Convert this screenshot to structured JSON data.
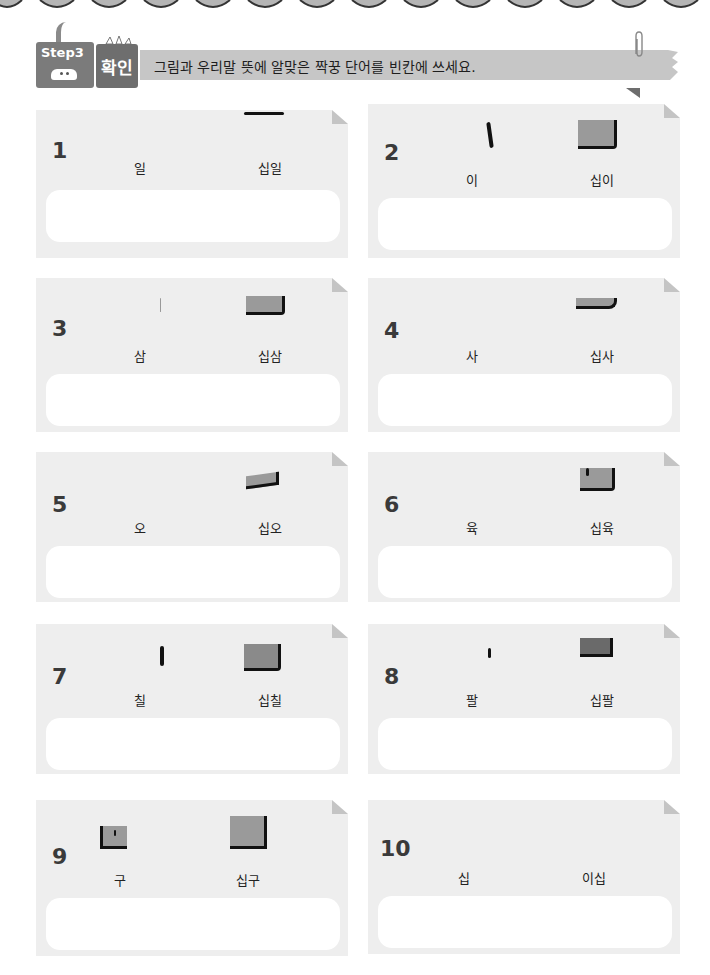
{
  "header": {
    "step_label": "Step3",
    "badge_label": "확인",
    "instruction": "그림과 우리말 뜻에 알맞은 짝꿍 단어를 빈칸에 쓰세요.",
    "decorations": [
      "scallop-border",
      "paperclip-icon",
      "critter-icon"
    ]
  },
  "cards": [
    {
      "number": "1",
      "word_left": "일",
      "word_right": "십일",
      "answer": ""
    },
    {
      "number": "2",
      "word_left": "이",
      "word_right": "십이",
      "answer": ""
    },
    {
      "number": "3",
      "word_left": "삼",
      "word_right": "십삼",
      "answer": ""
    },
    {
      "number": "4",
      "word_left": "사",
      "word_right": "십사",
      "answer": ""
    },
    {
      "number": "5",
      "word_left": "오",
      "word_right": "십오",
      "answer": ""
    },
    {
      "number": "6",
      "word_left": "육",
      "word_right": "십육",
      "answer": ""
    },
    {
      "number": "7",
      "word_left": "칠",
      "word_right": "십칠",
      "answer": ""
    },
    {
      "number": "8",
      "word_left": "팔",
      "word_right": "십팔",
      "answer": ""
    },
    {
      "number": "9",
      "word_left": "구",
      "word_right": "십구",
      "answer": ""
    },
    {
      "number": "10",
      "word_left": "십",
      "word_right": "이십",
      "answer": ""
    }
  ],
  "colors": {
    "card_bg": "#eeeeee",
    "banner_bg": "#c6c6c6",
    "step_box": "#7b7b7b",
    "badge_box": "#6e6e6e",
    "answer_box": "#ffffff"
  }
}
